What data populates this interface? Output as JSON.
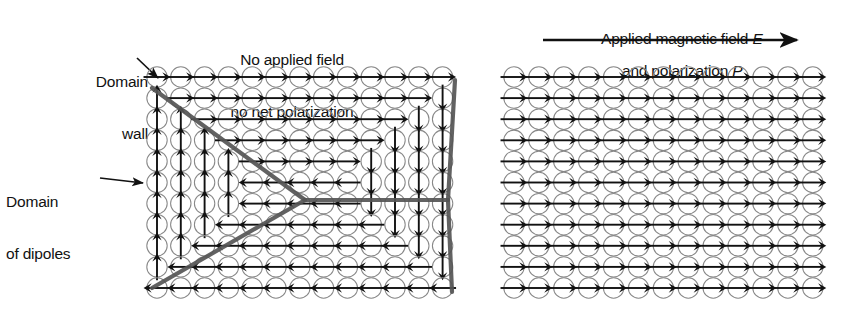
{
  "figure": {
    "background_color": "#ffffff",
    "ink_color": "#111111",
    "domain_wall_color": "#555555",
    "circle_stroke_color": "#888888"
  },
  "annotations": {
    "domain_wall": {
      "line1": "Domain",
      "line2": "wall",
      "pointer": "arrow-down-right"
    },
    "domain_of_dipoles": {
      "line1": "Domain",
      "line2": "of dipoles",
      "pointer": "arrow-right"
    }
  },
  "panels": [
    {
      "id": "left",
      "caption_line1": "No applied field",
      "caption_line2": "no net polarization",
      "has_field_arrow": false,
      "grid": {
        "cols": 13,
        "rows": 11,
        "origin_x": 157,
        "origin_y": 77,
        "step_x": 23.8,
        "step_y": 21.1,
        "radius": 10.2,
        "directions": [
          [
            "right",
            "right",
            "right",
            "right",
            "right",
            "right",
            "right",
            "right",
            "right",
            "right",
            "right",
            "right",
            "right"
          ],
          [
            "up",
            "right",
            "right",
            "right",
            "right",
            "right",
            "right",
            "right",
            "right",
            "right",
            "right",
            "right",
            "down"
          ],
          [
            "up",
            "up",
            "right",
            "right",
            "right",
            "right",
            "right",
            "right",
            "right",
            "right",
            "right",
            "down",
            "down"
          ],
          [
            "up",
            "up",
            "up",
            "right",
            "right",
            "right",
            "right",
            "right",
            "right",
            "right",
            "down",
            "down",
            "down"
          ],
          [
            "up",
            "up",
            "up",
            "up",
            "right",
            "right",
            "right",
            "right",
            "right",
            "down",
            "down",
            "down",
            "down"
          ],
          [
            "up",
            "up",
            "up",
            "up",
            "left",
            "left",
            "left",
            "left",
            "left",
            "down",
            "down",
            "down",
            "down"
          ],
          [
            "up",
            "up",
            "up",
            "up",
            "left",
            "left",
            "left",
            "left",
            "left",
            "down",
            "down",
            "down",
            "down"
          ],
          [
            "up",
            "up",
            "up",
            "left",
            "left",
            "left",
            "left",
            "left",
            "left",
            "left",
            "down",
            "down",
            "down"
          ],
          [
            "up",
            "up",
            "left",
            "left",
            "left",
            "left",
            "left",
            "left",
            "left",
            "left",
            "left",
            "down",
            "down"
          ],
          [
            "up",
            "left",
            "left",
            "left",
            "left",
            "left",
            "left",
            "left",
            "left",
            "left",
            "left",
            "left",
            "down"
          ],
          [
            "left",
            "left",
            "left",
            "left",
            "left",
            "left",
            "left",
            "left",
            "left",
            "left",
            "left",
            "left",
            "left"
          ]
        ]
      },
      "domain_walls": [
        {
          "name": "upper-left-wall",
          "points": [
            [
              152,
              88
            ],
            [
              305,
              200
            ]
          ]
        },
        {
          "name": "lower-left-wall",
          "points": [
            [
              305,
              200
            ],
            [
              152,
              288
            ]
          ]
        },
        {
          "name": "center-horizontal-wall",
          "points": [
            [
              305,
              200
            ],
            [
              448,
              200
            ]
          ]
        },
        {
          "name": "upper-right-wall",
          "points": [
            [
              448,
              200
            ],
            [
              455,
              80
            ]
          ]
        },
        {
          "name": "lower-right-wall",
          "points": [
            [
              448,
              200
            ],
            [
              452,
              292
            ]
          ]
        }
      ]
    },
    {
      "id": "right",
      "caption_line1": "Applied magnetic field E",
      "caption_line2": "and polarization P",
      "caption_line1_plain": "Applied magnetic field",
      "caption_line1_symbol": "E",
      "caption_line2_plain": "and polarization",
      "caption_line2_symbol": "P",
      "has_field_arrow": true,
      "field_arrow_direction": "right",
      "grid": {
        "cols": 13,
        "rows": 11,
        "origin_x": 514,
        "origin_y": 77,
        "step_x": 24.9,
        "step_y": 21.1,
        "radius": 10.2,
        "uniform_direction": "right"
      }
    }
  ]
}
